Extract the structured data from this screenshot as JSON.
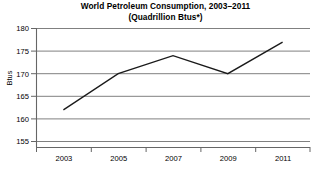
{
  "chart_data": {
    "type": "line",
    "title": "World Petroleum Consumption, 2003–2011",
    "subtitle": "(Quadrillion Btus*)",
    "xlabel": "",
    "ylabel": "Btus",
    "x": [
      2003,
      2005,
      2007,
      2009,
      2011
    ],
    "values": [
      162,
      170,
      174,
      170,
      177
    ],
    "series": [
      {
        "name": "World Petroleum Consumption",
        "values": [
          162,
          170,
          174,
          170,
          177
        ]
      }
    ],
    "categories": [
      "2003",
      "2005",
      "2007",
      "2009",
      "2011"
    ],
    "xlim": [
      2002,
      2012
    ],
    "ylim": [
      155,
      180
    ],
    "ytick_labels": [
      "180",
      "175",
      "170",
      "165",
      "160",
      "155"
    ],
    "ytick_values": [
      180,
      175,
      170,
      165,
      160,
      155
    ],
    "xtick_labels": [
      "2003",
      "2005",
      "2007",
      "2009",
      "2011"
    ],
    "xtick_values": [
      2003,
      2005,
      2007,
      2009,
      2011
    ],
    "grid": "horizontal",
    "legend": "none",
    "line_color": "#1a1a1a",
    "grid_color": "#808080",
    "axis_color": "#666666",
    "background_color": "#ffffff"
  }
}
